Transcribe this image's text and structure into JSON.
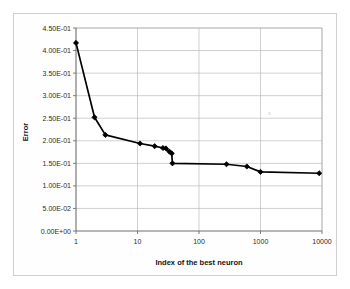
{
  "chart_data": {
    "type": "line",
    "title": "",
    "xlabel": "Index of the best neuron",
    "ylabel": "Error",
    "xscale": "log",
    "yscale": "linear",
    "xlim": [
      1,
      10000
    ],
    "ylim": [
      0.0,
      0.45
    ],
    "grid": true,
    "legend": false,
    "marker": "diamond",
    "line_color": "#000000",
    "marker_color": "#000000",
    "x_tick_labels": [
      "1",
      "10",
      "100",
      "1000",
      "10000"
    ],
    "x_tick_values": [
      1,
      10,
      100,
      1000,
      10000
    ],
    "y_tick_labels": [
      "0.00E+00",
      "5.00E-02",
      "1.00E-01",
      "1.50E-01",
      "2.00E-01",
      "2.50E-01",
      "3.00E-01",
      "3.50E-01",
      "4.00E-01",
      "4.50E-01"
    ],
    "y_tick_values": [
      0.0,
      0.05,
      0.1,
      0.15,
      0.2,
      0.25,
      0.3,
      0.35,
      0.4,
      0.45
    ],
    "series": [
      {
        "name": "Error",
        "x": [
          1,
          2,
          3,
          11,
          19,
          26,
          29,
          33,
          36,
          37,
          280,
          600,
          1000,
          9000
        ],
        "values": [
          0.417,
          0.252,
          0.213,
          0.194,
          0.188,
          0.184,
          0.183,
          0.176,
          0.172,
          0.15,
          0.148,
          0.143,
          0.131,
          0.128
        ]
      }
    ]
  },
  "axes": {
    "y_axis_title": "Error",
    "x_axis_title": "Index of the best neuron"
  }
}
